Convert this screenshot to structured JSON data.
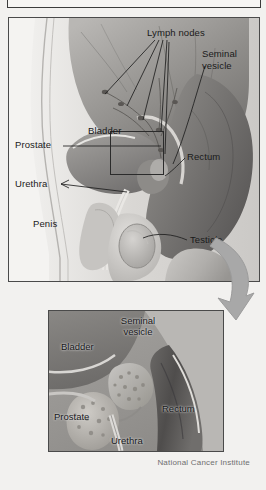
{
  "figure": {
    "credit": "National Cancer Institute",
    "style": "grayscale medical illustration"
  },
  "colors": {
    "page_background": "#f2f1ef",
    "panel_background": "#f4f3f1",
    "panel_border": "#4a4a4a",
    "label_text": "#1a1a1a",
    "credit_text": "#6f6f6f",
    "arrow_fill": "#a8a8a8",
    "tissue_light": "#cfcdca",
    "tissue_mid": "#9d9b98",
    "tissue_dark": "#6e6c6a",
    "tissue_darkest": "#4b4a49"
  },
  "main_panel": {
    "name": "main-anatomy-panel",
    "labels": [
      {
        "id": "lymph-nodes",
        "text": "Lymph nodes"
      },
      {
        "id": "seminal-vesicle",
        "text": "Seminal\nvesicle",
        "line1": "Seminal",
        "line2": "vesicle"
      },
      {
        "id": "bladder",
        "text": "Bladder"
      },
      {
        "id": "prostate",
        "text": "Prostate"
      },
      {
        "id": "rectum",
        "text": "Rectum"
      },
      {
        "id": "urethra",
        "text": "Urethra"
      },
      {
        "id": "penis",
        "text": "Penis"
      },
      {
        "id": "testicle",
        "text": "Testicle"
      }
    ],
    "magnification_box": {
      "present": true,
      "note": "region enlarged in inset"
    }
  },
  "inset_panel": {
    "name": "magnified-detail-panel",
    "labels": [
      {
        "id": "inset-seminal-vesicle",
        "text": "Seminal\nvesicle",
        "line1": "Seminal",
        "line2": "vesicle"
      },
      {
        "id": "inset-bladder",
        "text": "Bladder"
      },
      {
        "id": "inset-prostate",
        "text": "Prostate"
      },
      {
        "id": "inset-rectum",
        "text": "Rectum"
      },
      {
        "id": "inset-urethra",
        "text": "Urethra"
      }
    ]
  },
  "arrow": {
    "id": "magnify-arrow",
    "description": "curved arrow from main panel to inset"
  }
}
